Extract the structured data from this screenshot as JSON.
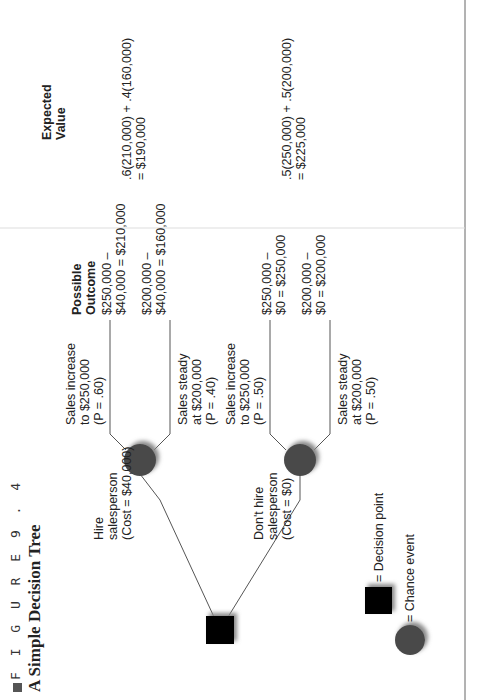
{
  "figure": {
    "label": "F I G U R E   9 . 4",
    "title": "A Simple Decision Tree"
  },
  "headers": {
    "outcome": "Possible\nOutcome",
    "expected_value": "Expected\nValue"
  },
  "decisions": [
    {
      "label": "Hire\nsalesperson\n(Cost = $40,000)",
      "branches": [
        {
          "label": "Sales increase\nto $250,000\n(P = .60)",
          "outcome": "$250,000 –\n$40,000 = $210,000"
        },
        {
          "label": "Sales steady\nat $200,000\n(P = .40)",
          "outcome": "$200,000 –\n$40,000 = $160,000"
        }
      ],
      "expected_value": ".6(210,000) + .4(160,000)\n= $190,000"
    },
    {
      "label": "Don't hire\nsalesperson\n(Cost = $0)",
      "branches": [
        {
          "label": "Sales increase\nto $250,000\n(P = .50)",
          "outcome": "$250,000 –\n$0 = $250,000"
        },
        {
          "label": "Sales steady\nat $200,000\n(P = .50)",
          "outcome": "$200,000 –\n$0 = $200,000"
        }
      ],
      "expected_value": ".5(250,000) + .5(200,000)\n= $225,000"
    }
  ],
  "legend": {
    "decision": "= Decision point",
    "chance": "= Chance event"
  },
  "colors": {
    "decision_node": "#000000",
    "chance_node": "#4a4a4a",
    "line": "#555555"
  }
}
